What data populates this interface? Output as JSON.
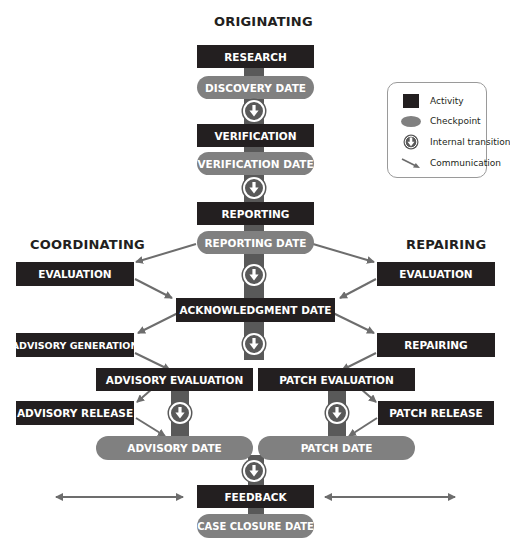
{
  "colors": {
    "activity": "#231f20",
    "checkpoint": "#808080",
    "spine": "#595959",
    "arrow": "#6d6d6d",
    "text_light": "#ffffff"
  },
  "headings": {
    "originating": "ORIGINATING",
    "coordinating": "COORDINATING",
    "repairing": "REPAIRING"
  },
  "legend": {
    "items": [
      {
        "symbol": "activity-square",
        "label": "Activity"
      },
      {
        "symbol": "checkpoint-ellipse",
        "label": "Checkpoint"
      },
      {
        "symbol": "transition-circle-arrow",
        "label": "Internal transition"
      },
      {
        "symbol": "diagonal-arrow",
        "label": "Communication"
      }
    ]
  },
  "originating": {
    "research": "RESEARCH",
    "discovery_date": "DISCOVERY DATE",
    "verification": "VERIFICATION",
    "verification_date": "VERIFICATION DATE",
    "reporting": "REPORTING",
    "reporting_date": "REPORTING DATE"
  },
  "coordinating": {
    "evaluation": "EVALUATION",
    "advisory_generation": "ADVISORY GENERATION",
    "advisory_evaluation": "ADVISORY EVALUATION",
    "advisory_release": "ADVISORY RELEASE",
    "advisory_date": "ADVISORY DATE"
  },
  "repairing": {
    "evaluation": "EVALUATION",
    "repairing": "REPAIRING",
    "patch_evaluation": "PATCH EVALUATION",
    "patch_release": "PATCH RELEASE",
    "patch_date": "PATCH DATE"
  },
  "shared": {
    "acknowledgment_date": "ACKNOWLEDGMENT DATE",
    "feedback": "FEEDBACK",
    "case_closure_date": "CASE CLOSURE DATE"
  }
}
